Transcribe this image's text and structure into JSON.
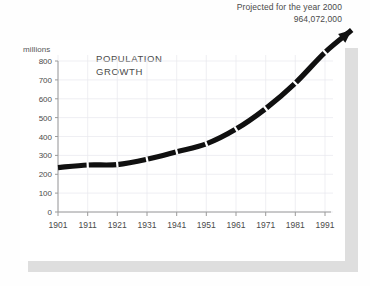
{
  "annotation": {
    "projected_line1": "Projected for the year 2000",
    "projected_line2": "964,072,000"
  },
  "chart_data": {
    "type": "line",
    "title": "POPULATION GROWTH",
    "title_line1": "POPULATION",
    "title_line2": "GROWTH",
    "units_label": "millions",
    "xlabel": "",
    "ylabel": "millions",
    "grid": true,
    "legend": "none",
    "xlim": [
      1901,
      2000
    ],
    "ylim": [
      0,
      800
    ],
    "ytick_labels": [
      "800",
      "700",
      "600",
      "500",
      "400",
      "300",
      "200",
      "100",
      "0"
    ],
    "yticks": [
      800,
      700,
      600,
      500,
      400,
      300,
      200,
      100,
      0
    ],
    "xtick_labels": [
      "1901",
      "1911",
      "1921",
      "1931",
      "1941",
      "1951",
      "1961",
      "1971",
      "1981",
      "1991"
    ],
    "xticks": [
      1901,
      1911,
      1921,
      1931,
      1941,
      1951,
      1961,
      1971,
      1981,
      1991
    ],
    "x": [
      1901,
      1911,
      1921,
      1931,
      1941,
      1951,
      1961,
      1971,
      1981,
      1991,
      2000
    ],
    "values": [
      235,
      249,
      251,
      279,
      319,
      361,
      439,
      548,
      683,
      846,
      964
    ],
    "series": [
      {
        "name": "Population",
        "values": [
          235,
          249,
          251,
          279,
          319,
          361,
          439,
          548,
          683,
          846,
          964
        ]
      }
    ],
    "marker_style": "white-tick-on-thick-black-line",
    "arrow_end": true,
    "line_color": "#101010",
    "grid_color": "#e8e8ee",
    "axis_color": "#9a9a9a",
    "text_color": "#4a4a4a",
    "annotation_value": 964072000
  }
}
